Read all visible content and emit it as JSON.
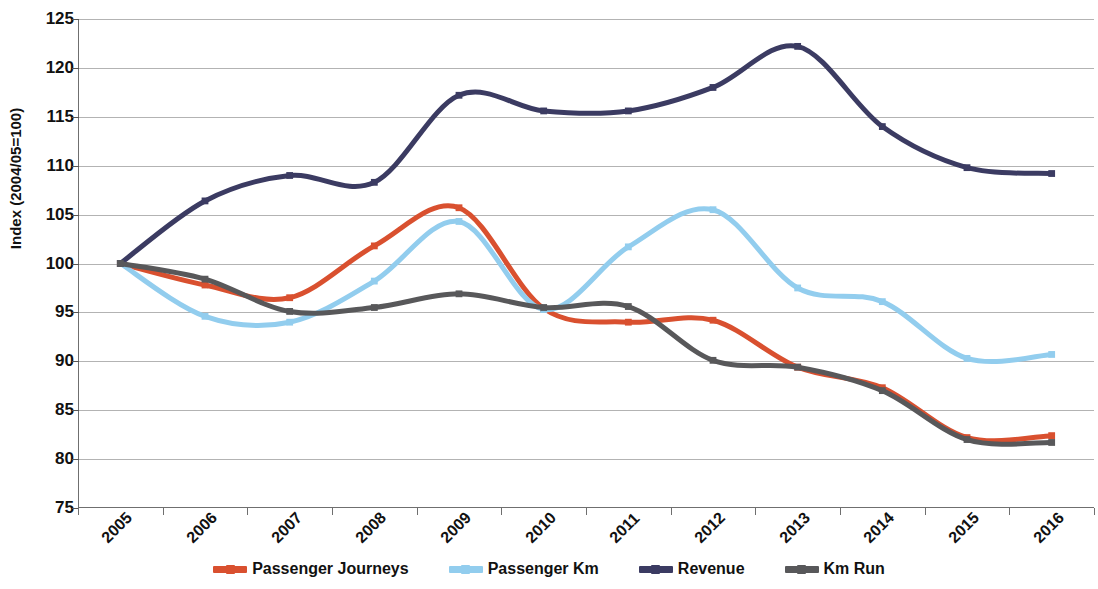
{
  "chart_data": {
    "type": "line",
    "title": "",
    "xlabel": "",
    "ylabel": "Index (2004/05=100)",
    "categories": [
      "2005",
      "2006",
      "2007",
      "2008",
      "2009",
      "2010",
      "2011",
      "2012",
      "2013",
      "2014",
      "2015",
      "2016"
    ],
    "yticks": [
      75,
      80,
      85,
      90,
      95,
      100,
      105,
      110,
      115,
      120,
      125
    ],
    "ylim": [
      75,
      125
    ],
    "grid": true,
    "legend_position": "bottom",
    "smoothing": "spline",
    "markers": true,
    "series": [
      {
        "name": "Passenger Journeys",
        "color": "#D9502F",
        "values": [
          100.0,
          97.8,
          96.5,
          101.8,
          105.7,
          95.4,
          94.0,
          94.2,
          89.4,
          87.3,
          82.2,
          82.4
        ]
      },
      {
        "name": "Passenger Km",
        "color": "#92CDEE",
        "values": [
          100.0,
          94.6,
          94.0,
          98.2,
          104.3,
          95.3,
          101.7,
          105.5,
          97.5,
          96.1,
          90.3,
          90.7
        ]
      },
      {
        "name": "Revenue",
        "color": "#3B3B62",
        "values": [
          100.0,
          106.4,
          109.0,
          108.3,
          117.2,
          115.6,
          115.6,
          118.0,
          122.2,
          114.0,
          109.8,
          109.2
        ]
      },
      {
        "name": "Km Run",
        "color": "#58585A",
        "values": [
          100.0,
          98.4,
          95.1,
          95.5,
          96.9,
          95.5,
          95.6,
          90.1,
          89.4,
          87.0,
          82.0,
          81.7
        ]
      }
    ]
  },
  "legend": {
    "items": [
      {
        "label": "Passenger Journeys",
        "color": "#D9502F"
      },
      {
        "label": "Passenger Km",
        "color": "#92CDEE"
      },
      {
        "label": "Revenue",
        "color": "#3B3B62"
      },
      {
        "label": "Km Run",
        "color": "#58585A"
      }
    ]
  }
}
